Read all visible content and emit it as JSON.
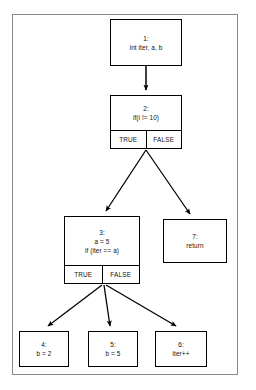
{
  "diagram": {
    "type": "control-flow-graph",
    "branch_labels": {
      "true": "TRUE",
      "false": "FALSE"
    },
    "nodes": [
      {
        "id": "1",
        "label": "1:",
        "lines": [
          "1:",
          "int iter, a, b"
        ],
        "has_branches": false
      },
      {
        "id": "2",
        "label": "2:",
        "lines": [
          "2:",
          "if(i != 10)"
        ],
        "has_branches": true,
        "true_label": "TRUE",
        "false_label": "FALSE"
      },
      {
        "id": "3",
        "label": "3:",
        "lines": [
          "3:",
          "a = 5",
          "if (iter == a)"
        ],
        "has_branches": true,
        "true_label": "TRUE",
        "false_label": "FALSE"
      },
      {
        "id": "4",
        "label": "4:",
        "lines": [
          "4:",
          "b = 2"
        ],
        "has_branches": false
      },
      {
        "id": "5",
        "label": "5:",
        "lines": [
          "5:",
          "b = 5"
        ],
        "has_branches": false
      },
      {
        "id": "6",
        "label": "6:",
        "lines": [
          "6:",
          "iter++"
        ],
        "has_branches": false
      },
      {
        "id": "7",
        "label": "7:",
        "lines": [
          "7:",
          "return"
        ],
        "has_branches": false
      }
    ],
    "edges": [
      {
        "from": "1",
        "to": "2",
        "label": ""
      },
      {
        "from": "2",
        "to": "3",
        "label": "TRUE"
      },
      {
        "from": "2",
        "to": "7",
        "label": "FALSE"
      },
      {
        "from": "3",
        "to": "4",
        "label": ""
      },
      {
        "from": "3",
        "to": "5",
        "label": ""
      },
      {
        "from": "3",
        "to": "6",
        "label": ""
      }
    ],
    "colors": {
      "node_border": "#000000",
      "node_fill": "#ffffff",
      "edge": "#000000",
      "frame_border": "#8a8a8a",
      "background": "#ffffff"
    }
  }
}
